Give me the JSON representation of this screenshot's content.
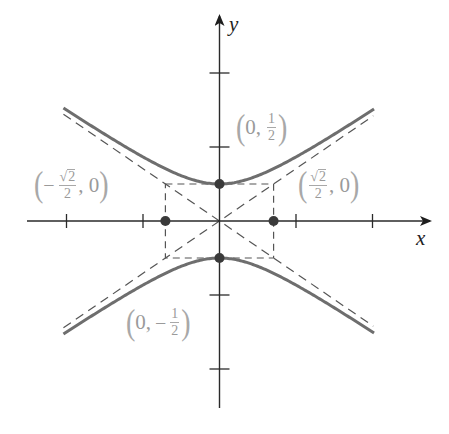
{
  "figure": {
    "axes": {
      "x_label": "x",
      "y_label": "y",
      "x_ticks": [
        -2,
        -1,
        1,
        2
      ],
      "y_ticks": [
        -2,
        -1,
        1,
        2
      ]
    },
    "labels": {
      "top_vertex": {
        "open": "(",
        "x": "0,",
        "num": "1",
        "den": "2",
        "close": ")"
      },
      "bottom_vertex": {
        "open": "(",
        "x": "0,",
        "sign": "−",
        "num": "1",
        "den": "2",
        "close": ")"
      },
      "left_point": {
        "open": "(",
        "sign": "−",
        "radical": "√",
        "rad_arg": "2",
        "den": "2",
        "y": ", 0",
        "close": ")"
      },
      "right_point": {
        "open": "(",
        "radical": "√",
        "rad_arg": "2",
        "den": "2",
        "y": ", 0",
        "close": ")"
      }
    },
    "colors": {
      "curve": "#6e6e6e",
      "axis": "#2a2a2a",
      "dashed": "#555555",
      "label": "#9a9a9a",
      "point": "#3a3a3a"
    }
  },
  "chart_data": {
    "type": "line",
    "title": "",
    "equation": "4y^2 - 2x^2 = 1",
    "xlabel": "x",
    "ylabel": "y",
    "xlim": [
      -2.5,
      2.8
    ],
    "ylim": [
      -2.5,
      2.75
    ],
    "grid": false,
    "series": [
      {
        "name": "upper branch",
        "style": "solid",
        "function": "y = sqrt(1/4 + x^2/2)",
        "x_range": [
          -2,
          2
        ]
      },
      {
        "name": "lower branch",
        "style": "solid",
        "function": "y = -sqrt(1/4 + x^2/2)",
        "x_range": [
          -2,
          2
        ]
      },
      {
        "name": "asymptote 1",
        "style": "dashed",
        "function": "y = x/sqrt(2)",
        "x_range": [
          -2,
          2
        ]
      },
      {
        "name": "asymptote 2",
        "style": "dashed",
        "function": "y = -x/sqrt(2)",
        "x_range": [
          -2,
          2
        ]
      }
    ],
    "rectangle": {
      "x": [
        -0.7071,
        0.7071
      ],
      "y": [
        -0.5,
        0.5
      ],
      "style": "dashed"
    },
    "points": [
      {
        "label": "(0, 1/2)",
        "x": 0,
        "y": 0.5
      },
      {
        "label": "(0, -1/2)",
        "x": 0,
        "y": -0.5
      },
      {
        "label": "(-√2/2, 0)",
        "x": -0.7071,
        "y": 0
      },
      {
        "label": "(√2/2, 0)",
        "x": 0.7071,
        "y": 0
      }
    ]
  }
}
